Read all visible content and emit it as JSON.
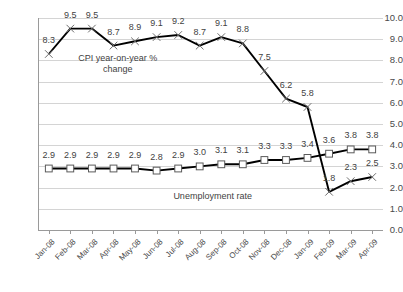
{
  "chart_data": {
    "type": "line",
    "title": "",
    "xlabel": "",
    "ylabel": "",
    "ylim": [
      0.0,
      10.0
    ],
    "ytick_step": 1.0,
    "grid": true,
    "legend_position": "inline-annotations",
    "categories": [
      "Jan-08",
      "Feb-08",
      "Mar-08",
      "Apr-08",
      "May-08",
      "Jun-08",
      "Jul-08",
      "Aug-08",
      "Sep-08",
      "Oct-08",
      "Nov-08",
      "Dec-08",
      "Jan-09",
      "Feb-09",
      "Mar-09",
      "Apr-09"
    ],
    "ytick_labels": [
      "0.0",
      "1.0",
      "2.0",
      "3.0",
      "4.0",
      "5.0",
      "6.0",
      "7.0",
      "8.0",
      "9.0",
      "10.0"
    ],
    "series": [
      {
        "name": "CPI year-on-year % change",
        "marker": "x",
        "color": "#000000",
        "values": [
          8.3,
          9.5,
          9.5,
          8.7,
          8.9,
          9.1,
          9.2,
          8.7,
          9.1,
          8.8,
          7.5,
          6.2,
          5.8,
          1.8,
          2.3,
          2.5
        ],
        "labels": [
          "8.3",
          "9.5",
          "9.5",
          "8.7",
          "8.9",
          "9.1",
          "9.2",
          "8.7",
          "9.1",
          "8.8",
          "7.5",
          "6.2",
          "5.8",
          "1.8",
          "2.3",
          "2.5"
        ]
      },
      {
        "name": "Unemployment rate",
        "marker": "square",
        "color": "#000000",
        "values": [
          2.9,
          2.9,
          2.9,
          2.9,
          2.9,
          2.8,
          2.9,
          3.0,
          3.1,
          3.1,
          3.3,
          3.3,
          3.4,
          3.6,
          3.8,
          3.8
        ],
        "labels": [
          "2.9",
          "2.9",
          "2.9",
          "2.9",
          "2.9",
          "2.8",
          "2.9",
          "3.0",
          "3.1",
          "3.1",
          "3.3",
          "3.3",
          "3.4",
          "3.6",
          "3.8",
          "3.8"
        ]
      }
    ],
    "annotations": [
      {
        "text": "CPI year-on-year %\nchange",
        "x_index": 3.2,
        "value": 8.35
      },
      {
        "text": "Unemployment rate",
        "x_index": 7.6,
        "value": 1.85
      }
    ]
  }
}
